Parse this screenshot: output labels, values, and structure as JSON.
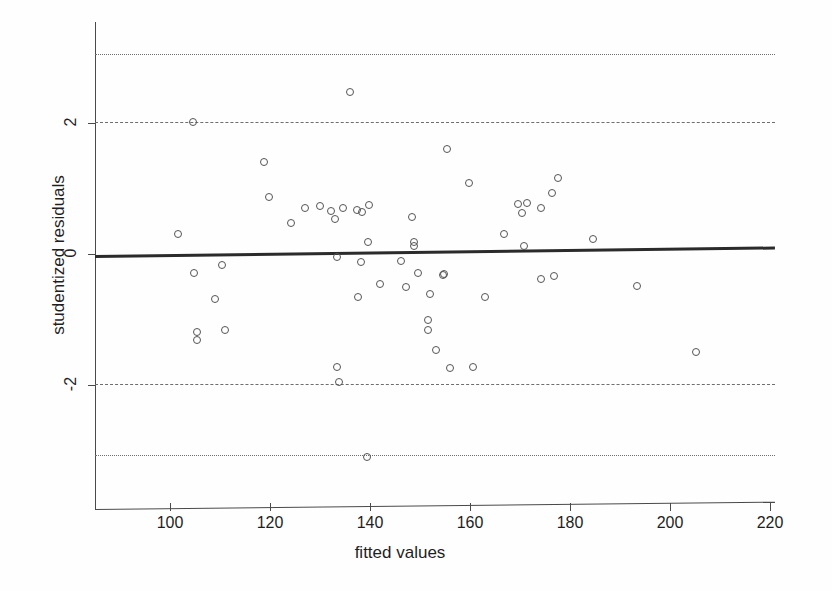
{
  "chart_data": {
    "type": "scatter",
    "title": "",
    "xlabel": "fitted values",
    "ylabel": "studentized residuals",
    "xlim": [
      87,
      223
    ],
    "ylim": [
      -3.45,
      3.5
    ],
    "xticks": [
      100,
      120,
      140,
      160,
      180,
      200,
      220
    ],
    "yticks": [
      2,
      0,
      -2
    ],
    "xticklabels": [
      "100",
      "120",
      "140",
      "160",
      "180",
      "200",
      "220"
    ],
    "yticklabels": [
      "2",
      "0",
      "-2"
    ],
    "grid": false,
    "legend": false,
    "reference_lines": [
      {
        "name": "upper-outlier-bound",
        "y": 3.05,
        "style": "dotted"
      },
      {
        "name": "upper-warning-bound",
        "y": 2.01,
        "style": "dashed"
      },
      {
        "name": "lower-warning-bound",
        "y": -1.99,
        "style": "dashed"
      },
      {
        "name": "lower-outlier-bound",
        "y": -3.07,
        "style": "dotted"
      }
    ],
    "fit_line": {
      "name": "loess-fit",
      "x0": 87,
      "y0": -0.02,
      "x1": 223,
      "y1": 0.11
    },
    "series": [
      {
        "name": "residuals",
        "marker": "open-circle",
        "color": "#555555",
        "points": [
          [
            104.6,
            2.01
          ],
          [
            136.0,
            2.47
          ],
          [
            118.8,
            1.41
          ],
          [
            155.4,
            1.6
          ],
          [
            119.8,
            0.87
          ],
          [
            159.8,
            1.08
          ],
          [
            177.6,
            1.16
          ],
          [
            176.4,
            0.93
          ],
          [
            124.2,
            0.47
          ],
          [
            101.6,
            0.31
          ],
          [
            127.0,
            0.7
          ],
          [
            130.0,
            0.73
          ],
          [
            132.2,
            0.66
          ],
          [
            134.6,
            0.7
          ],
          [
            137.4,
            0.67
          ],
          [
            138.4,
            0.64
          ],
          [
            139.8,
            0.75
          ],
          [
            133.0,
            0.53
          ],
          [
            148.4,
            0.56
          ],
          [
            169.6,
            0.76
          ],
          [
            171.4,
            0.78
          ],
          [
            174.2,
            0.7
          ],
          [
            170.4,
            0.63
          ],
          [
            166.8,
            0.31
          ],
          [
            184.6,
            0.23
          ],
          [
            139.6,
            0.18
          ],
          [
            148.8,
            0.19
          ],
          [
            148.8,
            0.12
          ],
          [
            170.8,
            0.12
          ],
          [
            133.4,
            -0.05
          ],
          [
            138.2,
            -0.12
          ],
          [
            146.2,
            -0.11
          ],
          [
            110.4,
            -0.17
          ],
          [
            104.8,
            -0.29
          ],
          [
            149.6,
            -0.29
          ],
          [
            154.8,
            -0.31
          ],
          [
            154.6,
            -0.32
          ],
          [
            174.2,
            -0.38
          ],
          [
            176.8,
            -0.34
          ],
          [
            193.4,
            -0.49
          ],
          [
            142.0,
            -0.46
          ],
          [
            147.2,
            -0.5
          ],
          [
            109.0,
            -0.69
          ],
          [
            137.6,
            -0.66
          ],
          [
            152.0,
            -0.61
          ],
          [
            163.0,
            -0.66
          ],
          [
            111.0,
            -1.16
          ],
          [
            105.4,
            -1.19
          ],
          [
            105.4,
            -1.31
          ],
          [
            151.6,
            -1.01
          ],
          [
            151.6,
            -1.16
          ],
          [
            153.2,
            -1.47
          ],
          [
            133.4,
            -1.73
          ],
          [
            133.8,
            -1.95
          ],
          [
            156.0,
            -1.74
          ],
          [
            160.6,
            -1.72
          ],
          [
            205.2,
            -1.5
          ],
          [
            139.4,
            -3.1
          ]
        ]
      }
    ]
  },
  "axes": {
    "x_title": "fitted values",
    "y_title": "studentized residuals"
  }
}
